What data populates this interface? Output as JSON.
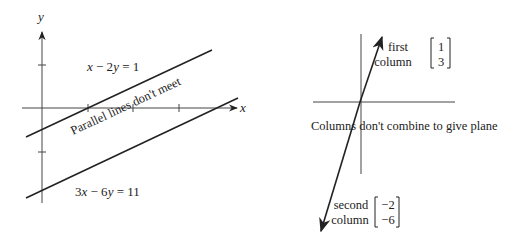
{
  "left_panel": {
    "axis_x_label": "x",
    "axis_y_label": "y",
    "line1_equation": {
      "a": "x − 2",
      "b": "y",
      "rhs": " = 1",
      "full": "x − 2y = 1"
    },
    "line2_equation": {
      "a": "3",
      "b": "x",
      "c": " − 6",
      "d": "y",
      "rhs": " = 11",
      "full": "3x − 6y = 11"
    },
    "annotation": "Parallel lines don't meet"
  },
  "right_panel": {
    "first_column": {
      "label_line1": "first",
      "label_line2": "column",
      "vector": [
        "1",
        "3"
      ]
    },
    "second_column": {
      "label_line1": "second",
      "label_line2": "column",
      "vector": [
        "−2",
        "−6"
      ]
    },
    "annotation": "Columns don't combine to give plane"
  },
  "colors": {
    "ink": "#222222",
    "background": "#ffffff"
  }
}
